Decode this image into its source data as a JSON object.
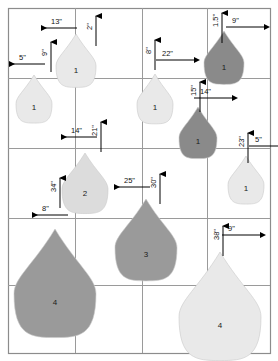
{
  "figure": {
    "background": "#ffffff",
    "width": 278,
    "height": 361
  },
  "grid": {
    "border_color": "#8c8c8c",
    "line_color": "#9a9a9a",
    "outer": {
      "x": 8,
      "y": 8,
      "w": 262,
      "h": 345
    },
    "vertical_lines": [
      75,
      142,
      207
    ],
    "horizontal_lines": [
      78,
      148,
      218,
      285
    ]
  },
  "palette": {
    "light": "#e9e9e9",
    "medium_light": "#dcdcdc",
    "medium": "#9a9a9a",
    "dark": "#8a8a8a",
    "outline": "#c9c9c9",
    "text": "#1a1a1a",
    "arrow": "#000000"
  },
  "droplets": [
    {
      "id": "drop-tl-1",
      "label": "1",
      "cx": 76,
      "cy": 64,
      "rw": 20,
      "rh": 30,
      "shade": "light"
    },
    {
      "id": "drop-l-1",
      "label": "1",
      "cx": 34,
      "cy": 102,
      "rw": 18,
      "rh": 27,
      "shade": "light"
    },
    {
      "id": "drop-m-1",
      "label": "1",
      "cx": 155,
      "cy": 102,
      "rw": 18,
      "rh": 28,
      "shade": "light"
    },
    {
      "id": "drop-tr-1",
      "label": "1",
      "cx": 224,
      "cy": 61,
      "rw": 20,
      "rh": 30,
      "shade": "dark"
    },
    {
      "id": "drop-r-1",
      "label": "1",
      "cx": 198,
      "cy": 136,
      "rw": 19,
      "rh": 29,
      "shade": "dark"
    },
    {
      "id": "drop-rr-1",
      "label": "1",
      "cx": 246,
      "cy": 183,
      "rw": 18,
      "rh": 27,
      "shade": "light"
    },
    {
      "id": "drop-2",
      "label": "2",
      "cx": 85,
      "cy": 187,
      "rw": 23,
      "rh": 34,
      "shade": "medium_light"
    },
    {
      "id": "drop-3",
      "label": "3",
      "cx": 146,
      "cy": 245,
      "rw": 31,
      "rh": 46,
      "shade": "medium"
    },
    {
      "id": "drop-4-left",
      "label": "4",
      "cx": 55,
      "cy": 290,
      "rw": 41,
      "rh": 61,
      "shade": "medium"
    },
    {
      "id": "drop-4-right",
      "label": "4",
      "cx": 220,
      "cy": 313,
      "rw": 41,
      "rh": 61,
      "shade": "light"
    }
  ],
  "dimensions": [
    {
      "id": "dim-13",
      "value": "13\"",
      "orient": "horizontal",
      "direction": "left",
      "label_x": 51,
      "label_y": 18
    },
    {
      "id": "dim-2",
      "value": "2\"",
      "orient": "vertical",
      "direction": "up",
      "label_x": 86,
      "label_y": 30
    },
    {
      "id": "dim-9a",
      "value": "9\"",
      "orient": "vertical",
      "direction": "up",
      "label_x": 41,
      "label_y": 56
    },
    {
      "id": "dim-5a",
      "value": "5\"",
      "orient": "horizontal",
      "direction": "left",
      "label_x": 19,
      "label_y": 54
    },
    {
      "id": "dim-8a",
      "value": "8\"",
      "orient": "vertical",
      "direction": "up",
      "label_x": 145,
      "label_y": 54
    },
    {
      "id": "dim-22",
      "value": "22\"",
      "orient": "horizontal",
      "direction": "right",
      "label_x": 162,
      "label_y": 50
    },
    {
      "id": "dim-15",
      "value": "1.5\"",
      "orient": "vertical",
      "direction": "up",
      "label_x": 212,
      "label_y": 27
    },
    {
      "id": "dim-9b",
      "value": "9\"",
      "orient": "horizontal",
      "direction": "right",
      "label_x": 232,
      "label_y": 17
    },
    {
      "id": "dim-15b",
      "value": "15\"",
      "orient": "vertical",
      "direction": "up",
      "label_x": 190,
      "label_y": 96
    },
    {
      "id": "dim-14a",
      "value": "14\"",
      "orient": "horizontal",
      "direction": "right",
      "label_x": 200,
      "label_y": 88
    },
    {
      "id": "dim-21",
      "value": "21\"",
      "orient": "vertical",
      "direction": "up",
      "label_x": 91,
      "label_y": 136
    },
    {
      "id": "dim-14b",
      "value": "14\"",
      "orient": "horizontal",
      "direction": "left",
      "label_x": 71,
      "label_y": 127
    },
    {
      "id": "dim-23",
      "value": "23\"",
      "orient": "vertical",
      "direction": "up",
      "label_x": 238,
      "label_y": 147
    },
    {
      "id": "dim-5b",
      "value": "5\"",
      "orient": "horizontal",
      "direction": "right",
      "label_x": 255,
      "label_y": 136
    },
    {
      "id": "dim-34",
      "value": "34\"",
      "orient": "vertical",
      "direction": "up",
      "label_x": 50,
      "label_y": 192
    },
    {
      "id": "dim-8b",
      "value": "8\"",
      "orient": "horizontal",
      "direction": "left",
      "label_x": 42,
      "label_y": 205
    },
    {
      "id": "dim-25",
      "value": "25\"",
      "orient": "horizontal",
      "direction": "left",
      "label_x": 124,
      "label_y": 177
    },
    {
      "id": "dim-30",
      "value": "30\"",
      "orient": "vertical",
      "direction": "up",
      "label_x": 150,
      "label_y": 188
    },
    {
      "id": "dim-38",
      "value": "38\"",
      "orient": "vertical",
      "direction": "up",
      "label_x": 213,
      "label_y": 240
    },
    {
      "id": "dim-9c",
      "value": "9\"",
      "orient": "horizontal",
      "direction": "right",
      "label_x": 228,
      "label_y": 225
    }
  ]
}
